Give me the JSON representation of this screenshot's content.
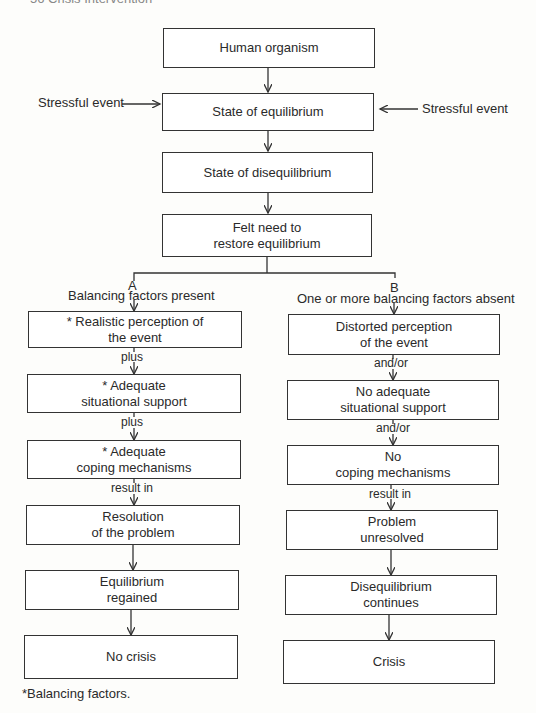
{
  "header": {
    "text": "56   Crisis Intervention"
  },
  "top": {
    "human_organism": "Human organism",
    "equilibrium": "State of equilibrium",
    "disequilibrium": "State of disequilibrium",
    "felt_need_1": "Felt need to",
    "felt_need_2": "restore equilibrium",
    "stress_left": "Stressful event",
    "stress_right": "Stressful event"
  },
  "branch_a": {
    "letter": "A",
    "heading": "Balancing factors present",
    "boxes": [
      {
        "line1": "* Realistic perception of",
        "line2": "the event"
      },
      {
        "line1": "* Adequate",
        "line2": "situational support"
      },
      {
        "line1": "* Adequate",
        "line2": "coping mechanisms"
      },
      {
        "line1": "Resolution",
        "line2": "of the problem"
      },
      {
        "line1": "Equilibrium",
        "line2": "regained"
      },
      {
        "line1": "No crisis",
        "line2": ""
      }
    ],
    "connectors": [
      "plus",
      "plus",
      "result in"
    ]
  },
  "branch_b": {
    "letter": "B",
    "heading": "One or more balancing factors absent",
    "boxes": [
      {
        "line1": "Distorted perception",
        "line2": "of the event"
      },
      {
        "line1": "No adequate",
        "line2": "situational support"
      },
      {
        "line1": "No",
        "line2": "coping mechanisms"
      },
      {
        "line1": "Problem",
        "line2": "unresolved"
      },
      {
        "line1": "Disequilibrium",
        "line2": "continues"
      },
      {
        "line1": "Crisis",
        "line2": ""
      }
    ],
    "connectors": [
      "and/or",
      "and/or",
      "result in"
    ]
  },
  "footnote": "*Balancing factors."
}
